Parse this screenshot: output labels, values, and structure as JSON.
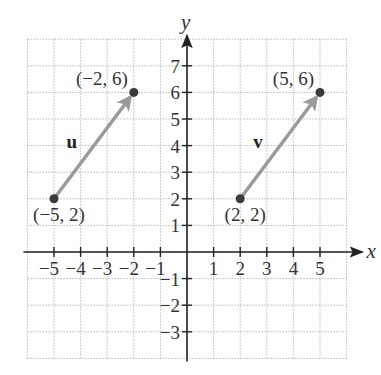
{
  "chart_data": {
    "type": "scatter",
    "title": "",
    "xlabel": "x",
    "ylabel": "y",
    "xlim": [
      -6,
      6
    ],
    "ylim": [
      -4,
      8
    ],
    "grid": true,
    "x_ticks": [
      -5,
      -4,
      -3,
      -2,
      -1,
      1,
      2,
      3,
      4,
      5
    ],
    "x_tick_labels": [
      "−5",
      "−4",
      "−3",
      "−2",
      "−1",
      "1",
      "2",
      "3",
      "4",
      "5"
    ],
    "y_ticks": [
      -3,
      -2,
      -1,
      1,
      2,
      3,
      4,
      5,
      6,
      7
    ],
    "y_tick_labels": [
      "−3",
      "−2",
      "−1",
      "1",
      "2",
      "3",
      "4",
      "5",
      "6",
      "7"
    ],
    "vectors": [
      {
        "name": "u",
        "start": [
          -5,
          2
        ],
        "end": [
          -2,
          6
        ],
        "start_label": "(−5, 2)",
        "end_label": "(−2, 6)"
      },
      {
        "name": "v",
        "start": [
          2,
          2
        ],
        "end": [
          5,
          6
        ],
        "start_label": "(2, 2)",
        "end_label": "(5, 6)"
      }
    ],
    "points": [
      [
        -5,
        2
      ],
      [
        -2,
        6
      ],
      [
        2,
        2
      ],
      [
        5,
        6
      ]
    ]
  },
  "colors": {
    "vector": "#9a9a9a",
    "point": "#3a3a3a",
    "axis": "#222222",
    "grid": "#b8b8b8"
  }
}
